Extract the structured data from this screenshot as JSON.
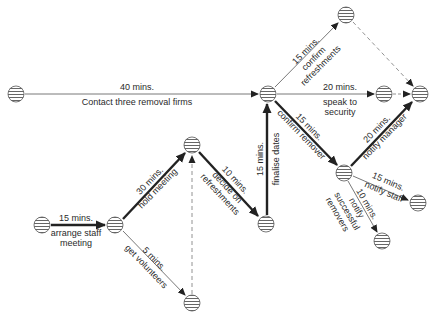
{
  "colors": {
    "stroke": "#222222",
    "thin": "#555555",
    "dashed": "#777777",
    "node_fill": "#ffffff",
    "hatch": "#555555"
  },
  "nodes": [
    {
      "id": "n1",
      "x": 16,
      "y": 94
    },
    {
      "id": "n2",
      "x": 42,
      "y": 225
    },
    {
      "id": "n3",
      "x": 115,
      "y": 225
    },
    {
      "id": "n4",
      "x": 192,
      "y": 145
    },
    {
      "id": "n5",
      "x": 192,
      "y": 303
    },
    {
      "id": "n6",
      "x": 266,
      "y": 224
    },
    {
      "id": "n7",
      "x": 268,
      "y": 94
    },
    {
      "id": "n8",
      "x": 346,
      "y": 15
    },
    {
      "id": "n9",
      "x": 384,
      "y": 94
    },
    {
      "id": "n10",
      "x": 420,
      "y": 94
    },
    {
      "id": "n11",
      "x": 344,
      "y": 173
    },
    {
      "id": "n12",
      "x": 418,
      "y": 203
    },
    {
      "id": "n13",
      "x": 382,
      "y": 241
    }
  ],
  "activities": [
    {
      "id": "a1",
      "from": "n1",
      "to": "n7",
      "type": "thin",
      "duration": "40 mins.",
      "label": "Contact three removal firms"
    },
    {
      "id": "a2",
      "from": "n2",
      "to": "n3",
      "type": "bold",
      "duration": "15 mins.",
      "label": "arrange staff meeting"
    },
    {
      "id": "a3",
      "from": "n3",
      "to": "n4",
      "type": "bold",
      "duration": "30 mins.",
      "label": "hold meeting"
    },
    {
      "id": "a4",
      "from": "n3",
      "to": "n5",
      "type": "thin",
      "duration": "5 mins.",
      "label": "get volunteers"
    },
    {
      "id": "a5",
      "from": "n5",
      "to": "n4",
      "type": "dashed",
      "duration": "",
      "label": ""
    },
    {
      "id": "a6",
      "from": "n4",
      "to": "n6",
      "type": "bold",
      "duration": "10 mins.",
      "label": "decide on refreshments"
    },
    {
      "id": "a7",
      "from": "n6",
      "to": "n7",
      "type": "bold",
      "duration": "15 mins.",
      "label": "finalise dates"
    },
    {
      "id": "a8",
      "from": "n7",
      "to": "n8",
      "type": "thin",
      "duration": "15 mins.",
      "label": "confirm refreshments"
    },
    {
      "id": "a9",
      "from": "n7",
      "to": "n9",
      "type": "thin",
      "duration": "20 mins.",
      "label": "speak to security"
    },
    {
      "id": "a10",
      "from": "n7",
      "to": "n11",
      "type": "bold",
      "duration": "15 mins.",
      "label": "confirm remover"
    },
    {
      "id": "a11",
      "from": "n8",
      "to": "n10",
      "type": "dashed",
      "duration": "",
      "label": ""
    },
    {
      "id": "a12",
      "from": "n9",
      "to": "n10",
      "type": "dashed",
      "duration": "",
      "label": ""
    },
    {
      "id": "a13",
      "from": "n11",
      "to": "n10",
      "type": "bold",
      "duration": "20 mins.",
      "label": "notify manager"
    },
    {
      "id": "a14",
      "from": "n11",
      "to": "n12",
      "type": "thin",
      "duration": "15 mins.",
      "label": "notify staff"
    },
    {
      "id": "a15",
      "from": "n11",
      "to": "n13",
      "type": "thin",
      "duration": "10 mins.",
      "label": "notify successful removers"
    }
  ],
  "labels": {
    "a1_dur": "40 mins.",
    "a1_lbl": "Contact three removal firms",
    "a2_dur": "15 mins.",
    "a2_lbl1": "arrange staff",
    "a2_lbl2": "meeting",
    "a3_dur": "30 mins.",
    "a3_lbl": "hold meeting",
    "a4_dur": "5 mins.",
    "a4_lbl": "get volunteers",
    "a6_dur": "10 mins.",
    "a6_lbl1": "decide on",
    "a6_lbl2": "refreshments",
    "a7_dur": "15 mins.",
    "a7_lbl": "finalise dates",
    "a8_dur": "15 mins.",
    "a8_lbl1": "confirm",
    "a8_lbl2": "refreshments",
    "a9_dur": "20 mins.",
    "a9_lbl1": "speak to",
    "a9_lbl2": "security",
    "a10_dur": "15 mins.",
    "a10_lbl": "confirm remover",
    "a13_dur": "20 mins.",
    "a13_lbl": "notify manager",
    "a14_dur": "15 mins.",
    "a14_lbl": "notify staff",
    "a15_dur": "10 mins.",
    "a15_lbl1": "notify",
    "a15_lbl2": "successful",
    "a15_lbl3": "removers"
  }
}
